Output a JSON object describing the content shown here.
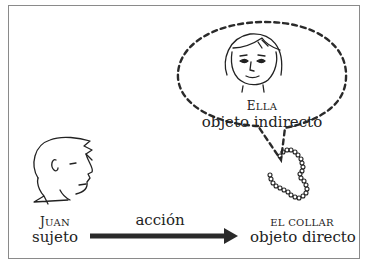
{
  "diagram": {
    "subject": {
      "name_first": "J",
      "name_rest": "UAN",
      "role": "sujeto"
    },
    "indirect_object": {
      "name_first": "E",
      "name_rest": "LLA",
      "role": "objeto indirecto"
    },
    "direct_object": {
      "name": "EL COLLAR",
      "role": "objeto directo"
    },
    "action": {
      "label": "acción"
    },
    "colors": {
      "stroke": "#222222",
      "frame": "#8a8a8a",
      "arrow": "#2a2a2a"
    }
  }
}
